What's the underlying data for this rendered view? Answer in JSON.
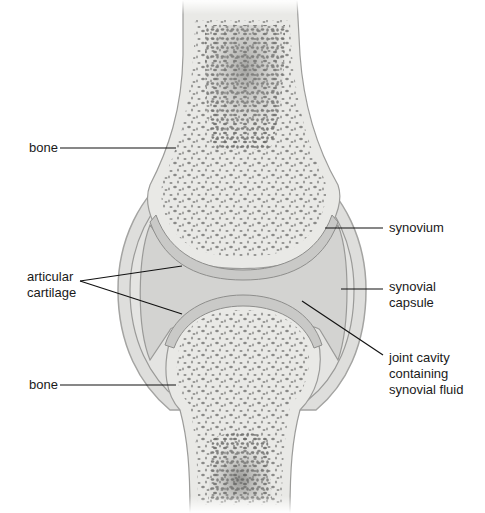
{
  "diagram": {
    "type": "anatomical-illustration",
    "colors": {
      "background": "#ffffff",
      "bone_fill": "#e9e9e6",
      "bone_edge": "#9c9c9a",
      "trabecular_dots": "#8f8f8d",
      "marrow_dark": "#6e6e6c",
      "cartilage": "#c9c9c7",
      "cartilage_edge": "#8e8e8c",
      "joint_cavity": "#d6d6d4",
      "capsule": "#dededc",
      "capsule_edge": "#a4a4a2",
      "leader_line": "#111111"
    }
  },
  "labels": {
    "bone_top": "bone",
    "articular_cartilage_line1": "articular",
    "articular_cartilage_line2": "cartilage",
    "bone_bottom": "bone",
    "synovium": "synovium",
    "synovial_capsule_line1": "synovial",
    "synovial_capsule_line2": "capsule",
    "joint_cavity_line1": "joint cavity",
    "joint_cavity_line2": "containing",
    "joint_cavity_line3": "synovial fluid"
  }
}
